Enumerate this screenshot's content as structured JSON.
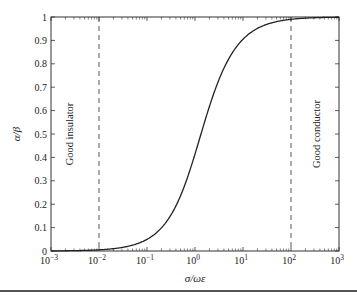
{
  "chart_data": {
    "type": "line",
    "title": "",
    "xlabel": "σ/ωε",
    "ylabel": "α/β",
    "xscale": "log",
    "xlim": [
      0.001,
      1000
    ],
    "ylim": [
      0,
      1
    ],
    "x_tick_labels": [
      "10-3",
      "10-2",
      "10-1",
      "100",
      "101",
      "102",
      "103"
    ],
    "x_tick_exponents": [
      "-3",
      "-2",
      "-1",
      "0",
      "1",
      "2",
      "3"
    ],
    "y_tick_labels": [
      "0",
      "0.1",
      "0.2",
      "0.3",
      "0.4",
      "0.5",
      "0.6",
      "0.7",
      "0.8",
      "0.9",
      "1"
    ],
    "grid": false,
    "legend": null,
    "series": [
      {
        "name": "α/β",
        "style": "solid",
        "formula": "sqrt((sqrt(1+x^2)-1)/(sqrt(1+x^2)+1))",
        "x": [
          0.001,
          0.01,
          0.03,
          0.1,
          0.2,
          0.3,
          0.5,
          0.7,
          1,
          1.5,
          2,
          3,
          5,
          7,
          10,
          20,
          30,
          100,
          1000
        ],
        "values": [
          0.0005,
          0.005,
          0.015,
          0.05,
          0.099,
          0.147,
          0.236,
          0.314,
          0.414,
          0.535,
          0.618,
          0.721,
          0.82,
          0.868,
          0.905,
          0.951,
          0.967,
          0.99,
          0.999
        ]
      }
    ],
    "annotations": [
      {
        "type": "vline",
        "x": 0.01,
        "style": "dashed"
      },
      {
        "type": "vline",
        "x": 100,
        "style": "dashed"
      },
      {
        "type": "text",
        "text": "Good insulator",
        "rotation": -90,
        "region": "left of x=0.01"
      },
      {
        "type": "text",
        "text": "Good conductor",
        "rotation": -90,
        "region": "right of x=100"
      }
    ]
  },
  "labels": {
    "xlabel": "σ/ωε",
    "ylabel": "α/β",
    "insulator": "Good insulator",
    "conductor": "Good conductor"
  }
}
